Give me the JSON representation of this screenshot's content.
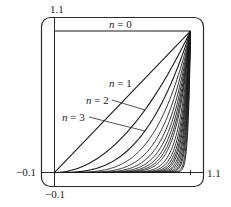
{
  "chart_data": {
    "type": "line",
    "title": "",
    "function": "y = x^n on [0,1]",
    "series": [
      {
        "name": "n = 0",
        "n": 0
      },
      {
        "name": "n = 1",
        "n": 1
      },
      {
        "name": "n = 2",
        "n": 2
      },
      {
        "name": "n = 3",
        "n": 3
      },
      {
        "name": "n = 4",
        "n": 4
      },
      {
        "name": "n = 5",
        "n": 5
      },
      {
        "name": "n = 6",
        "n": 6
      },
      {
        "name": "n = 7",
        "n": 7
      },
      {
        "name": "n = 8",
        "n": 8
      },
      {
        "name": "n = 9",
        "n": 9
      },
      {
        "name": "n = 10",
        "n": 10
      },
      {
        "name": "n = 12",
        "n": 12
      },
      {
        "name": "n = 14",
        "n": 14
      },
      {
        "name": "n = 16",
        "n": 16
      },
      {
        "name": "n = 18",
        "n": 18
      },
      {
        "name": "n = 20",
        "n": 20
      },
      {
        "name": "n = 23",
        "n": 23
      },
      {
        "name": "n = 26",
        "n": 26
      },
      {
        "name": "n = 30",
        "n": 30
      },
      {
        "name": "n = 35",
        "n": 35
      },
      {
        "name": "n = 40",
        "n": 40
      },
      {
        "name": "n = 50",
        "n": 50
      },
      {
        "name": "n = 60",
        "n": 60
      }
    ],
    "xlim": [
      -0.1,
      1.1
    ],
    "ylim": [
      -0.1,
      1.1
    ],
    "xlabel": "",
    "ylabel": "",
    "tick_labels": {
      "x_min": "−0.1",
      "x_max": "1.1",
      "y_min": "−0.1",
      "y_max": "1.1"
    },
    "annotations": [
      "n = 0",
      "n = 1",
      "n = 2",
      "n = 3"
    ],
    "grid": false,
    "legend": "none",
    "frame": "rounded rectangle"
  },
  "labels": {
    "y_top": "1.1",
    "y_bottom": "−0.1",
    "x_left": "−0.1",
    "x_right": "1.1",
    "n0": {
      "var": "n",
      "eq": " = 0"
    },
    "n1": {
      "var": "n",
      "eq": " = 1"
    },
    "n2": {
      "var": "n",
      "eq": " = 2"
    },
    "n3": {
      "var": "n",
      "eq": " = 3"
    }
  },
  "colors": {
    "line": "#1a1a1a",
    "frame": "#2a2a2a",
    "background": "#ffffff"
  }
}
